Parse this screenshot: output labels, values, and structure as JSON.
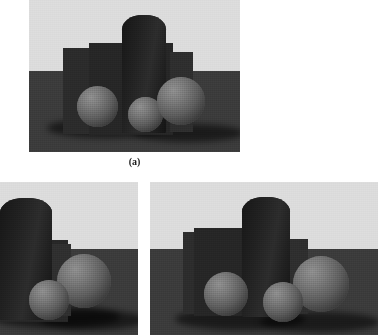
{
  "figure": {
    "caption_a": "(a)",
    "background_color": "#ffffff",
    "panels": [
      {
        "id": "panel-a",
        "label": "(a)",
        "role": "original-scene",
        "frame": {
          "x": 29,
          "y": 0,
          "w": 211,
          "h": 152
        },
        "wall_color": "#dcdcdc",
        "floor_color": "#3b3b3b",
        "horizon_y_ratio": 0.47,
        "objects": [
          {
            "name": "cylinder",
            "color": "#1d1d1d"
          },
          {
            "name": "box-slab",
            "color": "#2a2a2a"
          },
          {
            "name": "sphere-left",
            "color": "#6a6a6a"
          },
          {
            "name": "sphere-center",
            "color": "#777777"
          },
          {
            "name": "sphere-right",
            "color": "#6e6e6e"
          }
        ]
      },
      {
        "id": "panel-b",
        "label": "",
        "role": "cropped-view-left",
        "frame": {
          "x": 0,
          "y": 182,
          "w": 138,
          "h": 153
        },
        "wall_color": "#dcdcdc",
        "floor_color": "#3b3b3b",
        "horizon_y_ratio": 0.44,
        "objects": [
          {
            "name": "cylinder",
            "color": "#1d1d1d"
          },
          {
            "name": "box-slab",
            "color": "#2a2a2a"
          },
          {
            "name": "sphere-center",
            "color": "#777777"
          },
          {
            "name": "sphere-right",
            "color": "#6e6e6e"
          }
        ]
      },
      {
        "id": "panel-c",
        "label": "",
        "role": "cropped-view-right",
        "frame": {
          "x": 150,
          "y": 182,
          "w": 228,
          "h": 153
        },
        "wall_color": "#dcdcdc",
        "floor_color": "#3b3b3b",
        "horizon_y_ratio": 0.44,
        "objects": [
          {
            "name": "cylinder",
            "color": "#1d1d1d"
          },
          {
            "name": "box-slab",
            "color": "#2a2a2a"
          },
          {
            "name": "sphere-left",
            "color": "#6a6a6a"
          },
          {
            "name": "sphere-center",
            "color": "#777777"
          },
          {
            "name": "sphere-right",
            "color": "#6e6e6e"
          }
        ]
      }
    ]
  }
}
